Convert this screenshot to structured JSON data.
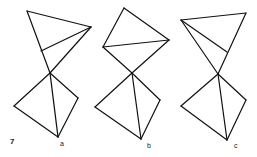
{
  "figure": {
    "number": "7",
    "line_color": "#111111",
    "panels": [
      {
        "label": "a",
        "label_pos": [
          60,
          140
        ],
        "lines": [
          [
            [
              27,
              11
            ],
            [
              91,
              27
            ]
          ],
          [
            [
              27,
              11
            ],
            [
              50,
              73
            ]
          ],
          [
            [
              91,
              27
            ],
            [
              41,
              51
            ]
          ],
          [
            [
              91,
              27
            ],
            [
              50,
              73
            ]
          ],
          [
            [
              50,
              73
            ],
            [
              14,
              106
            ]
          ],
          [
            [
              50,
              73
            ],
            [
              58,
              137
            ]
          ],
          [
            [
              50,
              73
            ],
            [
              78,
              98
            ]
          ],
          [
            [
              14,
              106
            ],
            [
              58,
              137
            ]
          ],
          [
            [
              78,
              98
            ],
            [
              58,
              137
            ]
          ]
        ]
      },
      {
        "label": "b",
        "label_pos": [
          147,
          142
        ],
        "lines": [
          [
            [
              124,
              8
            ],
            [
              169,
              40
            ]
          ],
          [
            [
              124,
              8
            ],
            [
              103,
              47
            ]
          ],
          [
            [
              103,
              47
            ],
            [
              169,
              40
            ]
          ],
          [
            [
              103,
              47
            ],
            [
              132,
              73
            ]
          ],
          [
            [
              169,
              40
            ],
            [
              132,
              73
            ]
          ],
          [
            [
              132,
              73
            ],
            [
              95,
              107
            ]
          ],
          [
            [
              132,
              73
            ],
            [
              141,
              139
            ]
          ],
          [
            [
              132,
              73
            ],
            [
              160,
              100
            ]
          ],
          [
            [
              95,
              107
            ],
            [
              141,
              139
            ]
          ],
          [
            [
              160,
              100
            ],
            [
              141,
              139
            ]
          ]
        ]
      },
      {
        "label": "c",
        "label_pos": [
          234,
          142
        ],
        "lines": [
          [
            [
              181,
              20
            ],
            [
              246,
              13
            ]
          ],
          [
            [
              181,
              20
            ],
            [
              227,
              52
            ]
          ],
          [
            [
              181,
              20
            ],
            [
              218,
              74
            ]
          ],
          [
            [
              246,
              13
            ],
            [
              218,
              74
            ]
          ],
          [
            [
              218,
              74
            ],
            [
              181,
              106
            ]
          ],
          [
            [
              218,
              74
            ],
            [
              227,
              140
            ]
          ],
          [
            [
              218,
              74
            ],
            [
              246,
              100
            ]
          ],
          [
            [
              181,
              106
            ],
            [
              227,
              140
            ]
          ],
          [
            [
              246,
              100
            ],
            [
              227,
              140
            ]
          ]
        ]
      }
    ]
  }
}
